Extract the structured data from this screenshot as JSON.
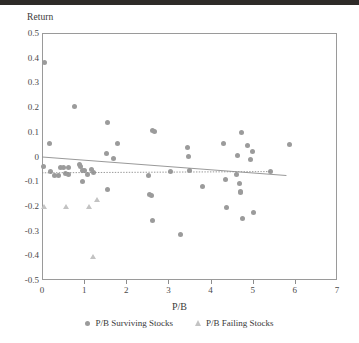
{
  "chart_data": {
    "type": "scatter",
    "title": "",
    "xlabel": "P/B",
    "ylabel": "Return",
    "xlim": [
      0,
      7
    ],
    "ylim": [
      -0.5,
      0.5
    ],
    "xticks": [
      "0",
      "1",
      "2",
      "3",
      "4",
      "5",
      "6",
      "7"
    ],
    "xtick_values": [
      0,
      1,
      2,
      3,
      4,
      5,
      6,
      7
    ],
    "yticks": [
      "0.5",
      "0.4",
      "0.3",
      "0.2",
      "0.1",
      "0",
      "-0.1",
      "-0.2",
      "-0.3",
      "-0.4",
      "-0.5"
    ],
    "ytick_values": [
      0.5,
      0.4,
      0.3,
      0.2,
      0.1,
      0,
      -0.1,
      -0.2,
      -0.3,
      -0.4,
      -0.5
    ],
    "grid": false,
    "legend_position": "bottom",
    "series": [
      {
        "name": "P/B Surviving Stocks",
        "marker": "circle",
        "color": "#9b9b9b",
        "points": [
          [
            0.05,
            0.38
          ],
          [
            0.03,
            -0.04
          ],
          [
            0.18,
            0.052
          ],
          [
            0.2,
            -0.062
          ],
          [
            0.3,
            -0.075
          ],
          [
            0.38,
            -0.078
          ],
          [
            0.45,
            -0.045
          ],
          [
            0.52,
            -0.045
          ],
          [
            0.55,
            -0.07
          ],
          [
            0.62,
            -0.045
          ],
          [
            0.63,
            -0.072
          ],
          [
            0.78,
            0.204
          ],
          [
            0.88,
            -0.033
          ],
          [
            0.92,
            -0.04
          ],
          [
            0.95,
            -0.057
          ],
          [
            0.97,
            -0.102
          ],
          [
            1.02,
            -0.058
          ],
          [
            1.08,
            -0.072
          ],
          [
            1.18,
            -0.052
          ],
          [
            1.22,
            -0.065
          ],
          [
            1.52,
            0.012
          ],
          [
            1.55,
            0.138
          ],
          [
            1.56,
            -0.135
          ],
          [
            1.7,
            -0.01
          ],
          [
            1.78,
            0.052
          ],
          [
            2.52,
            -0.078
          ],
          [
            2.55,
            -0.152
          ],
          [
            2.6,
            -0.157
          ],
          [
            2.62,
            0.105
          ],
          [
            2.66,
            0.103
          ],
          [
            2.63,
            -0.26
          ],
          [
            3.05,
            -0.06
          ],
          [
            3.28,
            -0.315
          ],
          [
            3.45,
            0.036
          ],
          [
            3.47,
            0.001
          ],
          [
            3.5,
            -0.055
          ],
          [
            3.82,
            -0.122
          ],
          [
            4.3,
            0.052
          ],
          [
            4.35,
            -0.092
          ],
          [
            4.38,
            -0.205
          ],
          [
            4.62,
            -0.072
          ],
          [
            4.65,
            0.006
          ],
          [
            4.68,
            -0.108
          ],
          [
            4.7,
            -0.142
          ],
          [
            4.72,
            -0.146
          ],
          [
            4.73,
            0.096
          ],
          [
            4.76,
            -0.252
          ],
          [
            4.88,
            0.043
          ],
          [
            4.95,
            -0.012
          ],
          [
            5.0,
            0.021
          ],
          [
            5.02,
            -0.228
          ],
          [
            5.42,
            -0.062
          ],
          [
            5.88,
            0.05
          ]
        ]
      },
      {
        "name": "P/B Failing Stocks",
        "marker": "triangle",
        "color": "#c3c3c3",
        "points": [
          [
            0.07,
            -0.203
          ],
          [
            0.58,
            -0.206
          ],
          [
            1.12,
            -0.203
          ],
          [
            1.32,
            -0.178
          ],
          [
            1.22,
            -0.408
          ]
        ]
      }
    ],
    "trendlines": [
      {
        "name": "surviving-trendline",
        "style": "solid",
        "color": "#8d8d8d",
        "x_start": 0.0,
        "y_start": -0.002,
        "x_end": 5.8,
        "y_end": -0.077
      },
      {
        "name": "failing-trendline",
        "style": "dotted",
        "color": "#8d8d8d",
        "x_start": 0.0,
        "y_start": -0.066,
        "x_end": 5.45,
        "y_end": -0.061
      }
    ]
  },
  "legend": {
    "entries": [
      {
        "label": "P/B Surviving Stocks",
        "marker": "circle",
        "color": "#9b9b9b"
      },
      {
        "label": "P/B Failing Stocks",
        "marker": "triangle",
        "color": "#c3c3c3"
      }
    ]
  },
  "colors": {
    "surviving": "#9b9b9b",
    "failing": "#c3c3c3",
    "axis": "#9a9a9a",
    "text": "#3a3a3a",
    "zero_line": "#d7d4d2",
    "top_band": "#2e2b28"
  }
}
